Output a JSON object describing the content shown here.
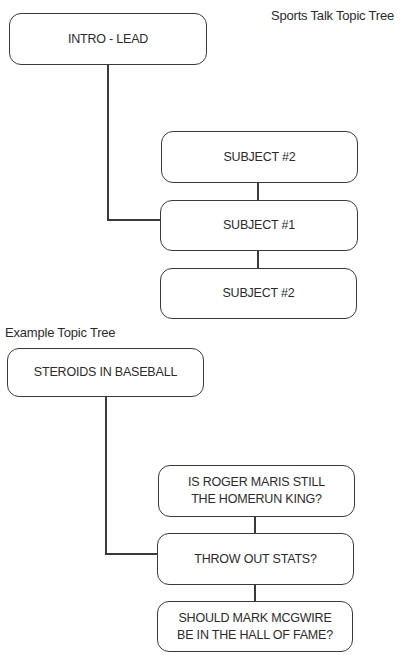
{
  "diagrams": [
    {
      "title": "Sports Talk Topic Tree",
      "root": "INTRO - LEAD",
      "children": [
        "SUBJECT #2",
        "SUBJECT #1",
        "SUBJECT #2"
      ]
    },
    {
      "title": "Example Topic Tree",
      "root": "STEROIDS IN BASEBALL",
      "children": [
        "IS ROGER MARIS STILL\nTHE HOMERUN KING?",
        "THROW OUT STATS?",
        "SHOULD MARK MCGWIRE\nBE IN THE HALL OF FAME?"
      ]
    }
  ]
}
